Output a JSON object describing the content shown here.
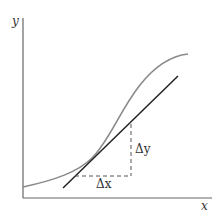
{
  "diagram": {
    "labels": {
      "y_axis": "y",
      "x_axis": "x",
      "delta_x": "Δx",
      "delta_y": "Δy"
    },
    "colors": {
      "axis": "#666666",
      "curve": "#8a8a8a",
      "tangent": "#222222",
      "dashed": "#555555",
      "text": "#333333"
    },
    "elements": [
      "y-axis",
      "x-axis",
      "curve",
      "tangent-line",
      "delta-x-dashed",
      "delta-y-dashed"
    ]
  }
}
